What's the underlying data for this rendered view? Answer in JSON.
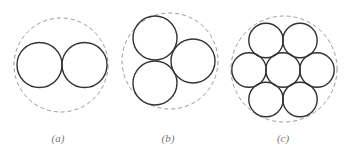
{
  "figure": {
    "colors": {
      "solid_stroke": "#333333",
      "dashed_stroke": "#999999",
      "label": "#777777"
    },
    "panels": [
      {
        "label": "(a)",
        "label_x": 58,
        "enclosing": {
          "cx": 61,
          "cy": 65,
          "r": 47
        },
        "circles": [
          {
            "cx": 39.5,
            "cy": 65,
            "r": 22.5
          },
          {
            "cx": 84.5,
            "cy": 65,
            "r": 22.5
          }
        ]
      },
      {
        "label": "(b)",
        "label_x": 168,
        "enclosing": {
          "cx": 170,
          "cy": 61,
          "r": 48
        },
        "circles": [
          {
            "cx": 155,
            "cy": 38,
            "r": 22
          },
          {
            "cx": 155,
            "cy": 83,
            "r": 22
          },
          {
            "cx": 193,
            "cy": 61,
            "r": 22
          }
        ]
      },
      {
        "label": "(c)",
        "label_x": 283,
        "enclosing": {
          "cx": 284,
          "cy": 69,
          "r": 53
        },
        "circles": [
          {
            "cx": 283,
            "cy": 70,
            "r": 17.2
          },
          {
            "cx": 266,
            "cy": 40.5,
            "r": 17.2
          },
          {
            "cx": 300,
            "cy": 40.5,
            "r": 17.2
          },
          {
            "cx": 249,
            "cy": 70,
            "r": 17.2
          },
          {
            "cx": 317,
            "cy": 70,
            "r": 17.2
          },
          {
            "cx": 266,
            "cy": 99.5,
            "r": 17.2
          },
          {
            "cx": 300,
            "cy": 99.5,
            "r": 17.2
          }
        ]
      }
    ]
  }
}
